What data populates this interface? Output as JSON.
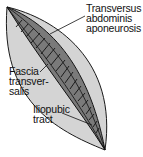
{
  "diagram": {
    "colors": {
      "background": "#ffffff",
      "leaf_fill": "#d4d4d4",
      "outline": "#1a1a1a",
      "band_fill": "#6e6e6e",
      "hatch": "#111111"
    },
    "labels": {
      "transversus": [
        "Transversus",
        "abdominis",
        "aponeurosis"
      ],
      "fascia": [
        "Fascia",
        "transver-",
        "salis"
      ],
      "iliopubic": [
        "Iliopubic",
        "tract"
      ]
    }
  }
}
